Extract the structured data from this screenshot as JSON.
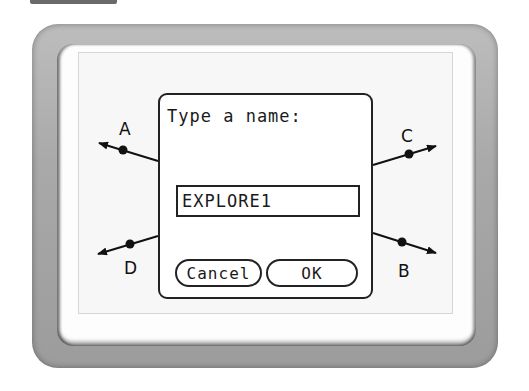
{
  "dialog": {
    "prompt": "Type a name:",
    "input_value": "EXPLORE1",
    "cancel_label": "Cancel",
    "ok_label": "OK"
  },
  "rays": [
    {
      "label": "A"
    },
    {
      "label": "B"
    },
    {
      "label": "C"
    },
    {
      "label": "D"
    }
  ]
}
